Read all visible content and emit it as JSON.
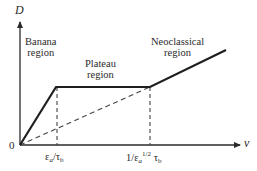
{
  "diagram": {
    "y_axis_label": "D",
    "x_axis_label": "ν",
    "origin_label": "0",
    "regions": [
      {
        "line1": "Banana",
        "line2": "region"
      },
      {
        "line1": "Plateau",
        "line2": "region"
      },
      {
        "line1": "Neoclassical",
        "line2": "region"
      }
    ],
    "ticks": [
      {
        "numerator": "ε",
        "num_sub": "a",
        "slash": "/",
        "denominator": "τ",
        "den_sub": "b"
      },
      {
        "prefix": "1/",
        "eps": "ε",
        "eps_sub": "a",
        "exp": "1/2",
        "tau": "τ",
        "tau_sub": "b"
      }
    ],
    "colors": {
      "line": "#1f1f1f",
      "dashed": "#444444",
      "text": "#2a2a2a"
    }
  }
}
